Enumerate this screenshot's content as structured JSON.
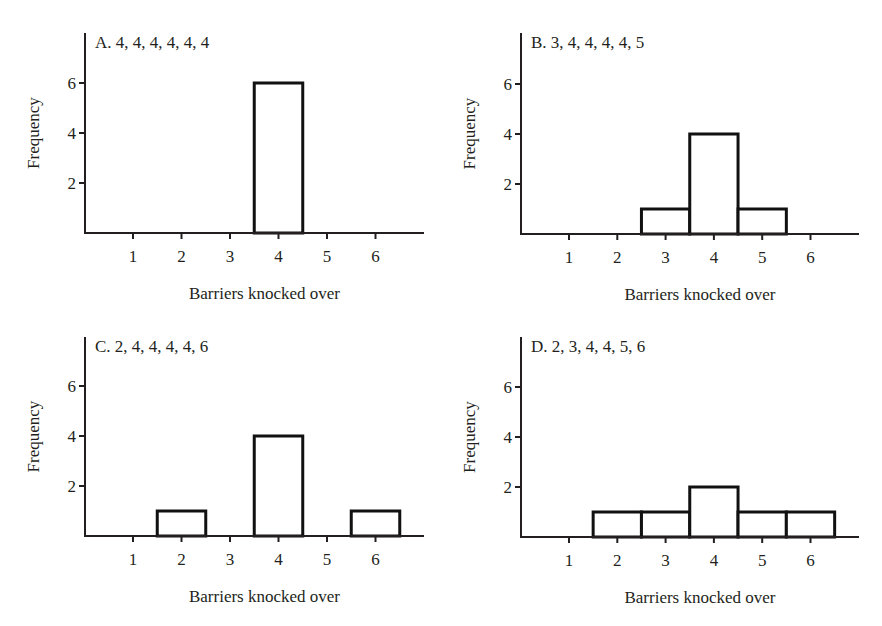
{
  "chart_data": [
    {
      "type": "bar",
      "panel": "A",
      "title": "A. 4, 4, 4, 4, 4, 4",
      "categories": [
        1,
        2,
        3,
        4,
        5,
        6
      ],
      "values": [
        0,
        0,
        0,
        6,
        0,
        0
      ],
      "xlabel": "Barriers knocked over",
      "ylabel": "Frequency",
      "yticks": [
        2,
        4,
        6
      ],
      "ylim": [
        0,
        8
      ],
      "xlim": [
        0,
        7
      ],
      "grid": false
    },
    {
      "type": "bar",
      "panel": "B",
      "title": "B. 3, 4, 4, 4, 4, 5",
      "categories": [
        1,
        2,
        3,
        4,
        5,
        6
      ],
      "values": [
        0,
        0,
        1,
        4,
        1,
        0
      ],
      "xlabel": "Barriers knocked over",
      "ylabel": "Frequency",
      "yticks": [
        2,
        4,
        6
      ],
      "ylim": [
        0,
        8
      ],
      "xlim": [
        0,
        7
      ],
      "grid": false
    },
    {
      "type": "bar",
      "panel": "C",
      "title": "C. 2, 4, 4, 4, 4, 6",
      "categories": [
        1,
        2,
        3,
        4,
        5,
        6
      ],
      "values": [
        0,
        1,
        0,
        4,
        0,
        1
      ],
      "xlabel": "Barriers knocked over",
      "ylabel": "Frequency",
      "yticks": [
        2,
        4,
        6
      ],
      "ylim": [
        0,
        8
      ],
      "xlim": [
        0,
        7
      ],
      "grid": false
    },
    {
      "type": "bar",
      "panel": "D",
      "title": "D. 2, 3, 4, 4, 5, 6",
      "categories": [
        1,
        2,
        3,
        4,
        5,
        6
      ],
      "values": [
        0,
        1,
        1,
        2,
        1,
        1
      ],
      "xlabel": "Barriers knocked over",
      "ylabel": "Frequency",
      "yticks": [
        2,
        4,
        6
      ],
      "ylim": [
        0,
        8
      ],
      "xlim": [
        0,
        7
      ],
      "grid": false
    }
  ],
  "layout": {
    "panels": [
      {
        "x0": 85,
        "y0": 233,
        "ytop": 33,
        "xend": 424,
        "tick1": 133,
        "xstep": 48.5,
        "ystep": 25
      },
      {
        "x0": 521,
        "y0": 234,
        "ytop": 33,
        "xend": 859,
        "tick1": 569,
        "xstep": 48.3,
        "ystep": 25
      },
      {
        "x0": 85,
        "y0": 536,
        "ytop": 337,
        "xend": 424,
        "tick1": 133,
        "xstep": 48.5,
        "ystep": 25
      },
      {
        "x0": 521,
        "y0": 537,
        "ytop": 337,
        "xend": 859,
        "tick1": 569,
        "xstep": 48.3,
        "ystep": 25
      }
    ]
  }
}
